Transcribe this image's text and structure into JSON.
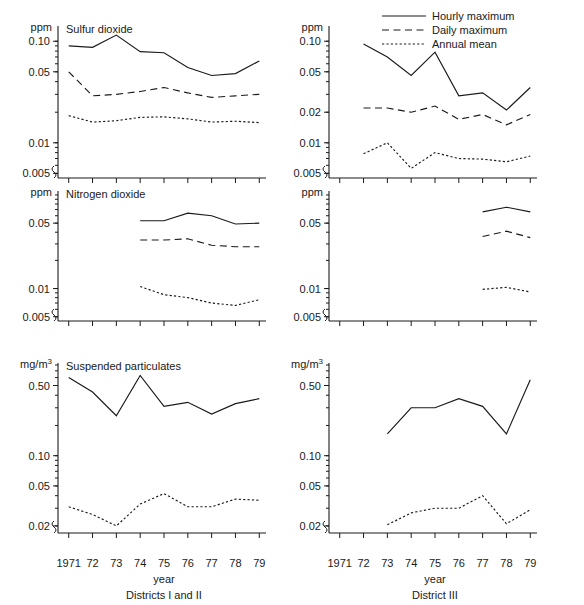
{
  "figure": {
    "x_label": "year",
    "x_ticks": [
      "1971",
      "72",
      "73",
      "74",
      "75",
      "76",
      "77",
      "78",
      "79"
    ],
    "x_values": [
      1971,
      1972,
      1973,
      1974,
      1975,
      1976,
      1977,
      1978,
      1979
    ],
    "column_captions": [
      "Districts I and II",
      "District III"
    ],
    "legend": {
      "position": "top-right",
      "entries": [
        {
          "label": "Hourly maximum",
          "style": "solid",
          "name": "hourly-maximum"
        },
        {
          "label": "Daily maximum",
          "style": "dashed",
          "name": "daily-maximum"
        },
        {
          "label": "Annual mean",
          "style": "dotted",
          "name": "annual-mean"
        }
      ]
    }
  },
  "chart_data": [
    {
      "type": "line",
      "panel": "top-left",
      "title": "Sulfur dioxide",
      "district": "Districts I and II",
      "ylabel": "ppm",
      "xlabel": "year",
      "yscale": "log",
      "ylim": [
        0.0045,
        0.135
      ],
      "ytick_labels": [
        "0.10",
        "0.05",
        "0.01",
        "0.005"
      ],
      "ytick_values": [
        0.1,
        0.05,
        0.01,
        0.005
      ],
      "grid": false,
      "x": [
        1971,
        1972,
        1973,
        1974,
        1975,
        1976,
        1977,
        1978,
        1979
      ],
      "series": [
        {
          "name": "Hourly maximum",
          "style": "solid",
          "values": [
            0.09,
            0.087,
            0.115,
            0.079,
            0.077,
            0.055,
            0.046,
            0.048,
            0.064
          ]
        },
        {
          "name": "Daily maximum",
          "style": "dashed",
          "values": [
            0.05,
            0.029,
            0.03,
            0.032,
            0.035,
            0.031,
            0.028,
            0.029,
            0.03
          ]
        },
        {
          "name": "Annual mean",
          "style": "dotted",
          "values": [
            0.0185,
            0.016,
            0.0165,
            0.0178,
            0.018,
            0.0172,
            0.016,
            0.0163,
            0.0158
          ]
        }
      ]
    },
    {
      "type": "line",
      "panel": "top-right",
      "title": "Sulfur dioxide",
      "district": "District III",
      "ylabel": "ppm",
      "xlabel": "year",
      "yscale": "log",
      "ylim": [
        0.0045,
        0.135
      ],
      "ytick_labels": [
        "0.10",
        "0.05",
        "0.02",
        "0.01",
        "0.005"
      ],
      "ytick_values": [
        0.1,
        0.05,
        0.02,
        0.01,
        0.005
      ],
      "grid": false,
      "x": [
        1971,
        1972,
        1973,
        1974,
        1975,
        1976,
        1977,
        1978,
        1979
      ],
      "series": [
        {
          "name": "Hourly maximum",
          "style": "solid",
          "values": [
            null,
            0.094,
            0.07,
            0.046,
            0.078,
            0.029,
            0.031,
            0.021,
            0.035
          ]
        },
        {
          "name": "Daily maximum",
          "style": "dashed",
          "values": [
            null,
            0.022,
            0.022,
            0.02,
            0.023,
            0.017,
            0.019,
            0.015,
            0.019
          ]
        },
        {
          "name": "Annual mean",
          "style": "dotted",
          "values": [
            null,
            0.0078,
            0.01,
            0.0056,
            0.008,
            0.007,
            0.0069,
            0.0065,
            0.0074
          ]
        }
      ]
    },
    {
      "type": "line",
      "panel": "middle-left",
      "title": "Nitrogen dioxide",
      "district": "Districts I and II",
      "ylabel": "ppm",
      "xlabel": "year",
      "yscale": "log",
      "ylim": [
        0.0045,
        0.105
      ],
      "ytick_labels": [
        "0.05",
        "0.01",
        "0.005"
      ],
      "ytick_values": [
        0.05,
        0.01,
        0.005
      ],
      "grid": false,
      "x": [
        1971,
        1972,
        1973,
        1974,
        1975,
        1976,
        1977,
        1978,
        1979
      ],
      "series": [
        {
          "name": "Hourly maximum",
          "style": "solid",
          "values": [
            null,
            null,
            null,
            0.053,
            0.053,
            0.064,
            0.06,
            0.049,
            0.05
          ]
        },
        {
          "name": "Daily maximum",
          "style": "dashed",
          "values": [
            null,
            null,
            null,
            0.033,
            0.033,
            0.034,
            0.029,
            0.028,
            0.028
          ]
        },
        {
          "name": "Annual mean",
          "style": "dotted",
          "values": [
            null,
            null,
            null,
            0.0105,
            0.0086,
            0.008,
            0.007,
            0.0066,
            0.0076
          ]
        }
      ]
    },
    {
      "type": "line",
      "panel": "middle-right",
      "title": "Nitrogen dioxide",
      "district": "District III",
      "ylabel": "ppm",
      "xlabel": "year",
      "yscale": "log",
      "ylim": [
        0.0045,
        0.105
      ],
      "ytick_labels": [
        "0.05",
        "0.01",
        "0.005"
      ],
      "ytick_values": [
        0.05,
        0.01,
        0.005
      ],
      "grid": false,
      "x": [
        1971,
        1972,
        1973,
        1974,
        1975,
        1976,
        1977,
        1978,
        1979
      ],
      "series": [
        {
          "name": "Hourly maximum",
          "style": "solid",
          "values": [
            null,
            null,
            null,
            null,
            null,
            null,
            0.066,
            0.074,
            0.066
          ]
        },
        {
          "name": "Daily maximum",
          "style": "dashed",
          "values": [
            null,
            null,
            null,
            null,
            null,
            null,
            0.036,
            0.041,
            0.035
          ]
        },
        {
          "name": "Annual mean",
          "style": "dotted",
          "values": [
            null,
            null,
            null,
            null,
            null,
            null,
            0.0098,
            0.0103,
            0.0092
          ]
        }
      ]
    },
    {
      "type": "line",
      "panel": "bottom-left",
      "title": "Suspended particulates",
      "district": "Districts I and II",
      "ylabel": "mg/m3",
      "xlabel": "year",
      "yscale": "log",
      "ylim": [
        0.017,
        0.8
      ],
      "ytick_labels": [
        "0.50",
        "0.10",
        "0.05",
        "0.02"
      ],
      "ytick_values": [
        0.5,
        0.1,
        0.05,
        0.02
      ],
      "grid": false,
      "x": [
        1971,
        1972,
        1973,
        1974,
        1975,
        1976,
        1977,
        1978,
        1979
      ],
      "series": [
        {
          "name": "Hourly maximum",
          "style": "solid",
          "values": [
            0.6,
            0.43,
            0.25,
            0.63,
            0.31,
            0.34,
            0.26,
            0.33,
            0.37
          ]
        },
        {
          "name": "Annual mean",
          "style": "dotted",
          "values": [
            0.031,
            0.026,
            0.02,
            0.033,
            0.042,
            0.031,
            0.031,
            0.037,
            0.036
          ]
        }
      ]
    },
    {
      "type": "line",
      "panel": "bottom-right",
      "title": "Suspended particulates",
      "district": "District III",
      "ylabel": "mg/m3",
      "xlabel": "year",
      "yscale": "log",
      "ylim": [
        0.017,
        0.8
      ],
      "ytick_labels": [
        "0.50",
        "0.10",
        "0.05",
        "0.02"
      ],
      "ytick_values": [
        0.5,
        0.1,
        0.05,
        0.02
      ],
      "grid": false,
      "x": [
        1971,
        1972,
        1973,
        1974,
        1975,
        1976,
        1977,
        1978,
        1979
      ],
      "series": [
        {
          "name": "Hourly maximum",
          "style": "solid",
          "values": [
            null,
            null,
            0.165,
            0.3,
            0.3,
            0.37,
            0.31,
            0.165,
            0.57
          ]
        },
        {
          "name": "Annual mean",
          "style": "dotted",
          "values": [
            null,
            null,
            0.0205,
            0.027,
            0.03,
            0.03,
            0.04,
            0.021,
            0.029
          ]
        }
      ]
    }
  ]
}
